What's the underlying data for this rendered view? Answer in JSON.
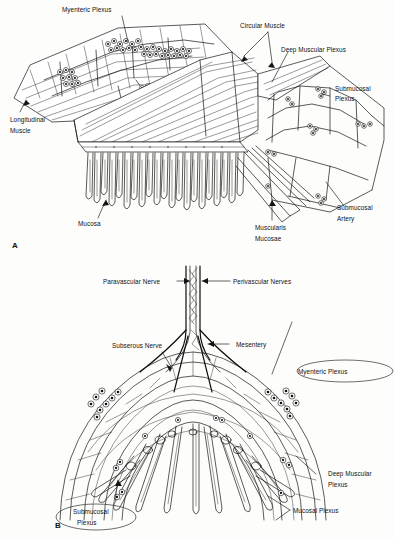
{
  "figure": {
    "background_color": "#fdfdfc",
    "ink_color": "#141414",
    "annotation_color": "#3c3c3c"
  },
  "panel_a": {
    "marker": "A",
    "labels": {
      "myenteric_plexus": "Myenteric Plexus",
      "circular_muscle": "Circular Muscle",
      "deep_muscular_plexus": "Deep Muscular Plexus",
      "submucosal_plexus_line1": "Submucosal",
      "submucosal_plexus_line2": "Plexus",
      "longitudinal_muscle_line1": "Longitudinal",
      "longitudinal_muscle_line2": "Muscle",
      "mucosa": "Mucosa",
      "muscularis_mucosae_line1": "Muscularis",
      "muscularis_mucosae_line2": "Mucosae",
      "submucosal_artery_line1": "Submucosal",
      "submucosal_artery_line2": "Artery"
    }
  },
  "panel_b": {
    "marker": "B",
    "labels": {
      "paravascular_nerve": "Paravascular Nerve",
      "perivascular_nerves": "Perivascular Nerves",
      "subserous_nerve": "Subserous Nerve",
      "mesentery": "Mesentery",
      "myenteric_plexus": "Myenteric Plexus",
      "deep_muscular_plexus_line1": "Deep Muscular",
      "deep_muscular_plexus_line2": "Plexus",
      "mucosal_plexus": "Mucosal Plexus",
      "submucosal_plexus_line1": "Submucosal",
      "submucosal_plexus_line2": "Plexus"
    },
    "circled_labels": [
      "Myenteric Plexus",
      "Submucosal Plexus"
    ]
  }
}
